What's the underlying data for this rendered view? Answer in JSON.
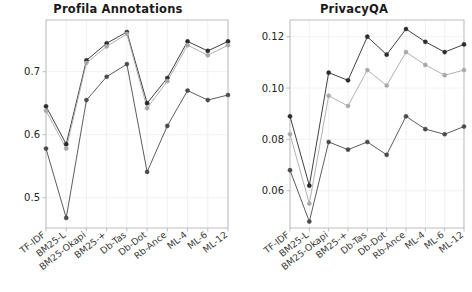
{
  "figure": {
    "width": 472,
    "height": 292,
    "background": "#ffffff"
  },
  "chart_data": [
    {
      "type": "line",
      "title": "Profila Annotations",
      "xlabel": "",
      "ylabel": "",
      "grid": true,
      "legend": "none",
      "categories": [
        "TF-IDF",
        "BM25-L",
        "BM25-Okapi",
        "BM25-+",
        "Db-Tas",
        "Db-Dot",
        "Rb-Ance",
        "ML-4",
        "ML-6",
        "ML-12"
      ],
      "ylim": [
        0.452,
        0.782
      ],
      "yticks": [
        0.5,
        0.6,
        0.7
      ],
      "ytick_labels": [
        "0.5",
        "0.6",
        "0.7"
      ],
      "series": [
        {
          "name": "series-1",
          "color": "#2b2b2b",
          "values": [
            0.645,
            0.585,
            0.718,
            0.745,
            0.763,
            0.65,
            0.69,
            0.748,
            0.733,
            0.748
          ]
        },
        {
          "name": "series-2",
          "color": "#a8a8a8",
          "values": [
            0.638,
            0.578,
            0.714,
            0.74,
            0.76,
            0.642,
            0.685,
            0.742,
            0.726,
            0.742
          ]
        },
        {
          "name": "series-3",
          "color": "#4a4a4a",
          "values": [
            0.578,
            0.468,
            0.655,
            0.692,
            0.712,
            0.541,
            0.614,
            0.67,
            0.655,
            0.663
          ]
        }
      ]
    },
    {
      "type": "line",
      "title": "PrivacyQA",
      "xlabel": "",
      "ylabel": "",
      "grid": true,
      "legend": "none",
      "categories": [
        "TF-IDF",
        "BM25-L",
        "BM25-Okapi",
        "BM25-+",
        "Db-Tas",
        "Db-Dot",
        "Rb-Ance",
        "ML-4",
        "ML-6",
        "ML-12"
      ],
      "ylim": [
        0.0455,
        0.1265
      ],
      "yticks": [
        0.06,
        0.08,
        0.1,
        0.12
      ],
      "ytick_labels": [
        "0.06",
        "0.08",
        "0.10",
        "0.12"
      ],
      "series": [
        {
          "name": "series-1",
          "color": "#2b2b2b",
          "values": [
            0.089,
            0.062,
            0.106,
            0.103,
            0.12,
            0.113,
            0.123,
            0.118,
            0.114,
            0.117
          ]
        },
        {
          "name": "series-2",
          "color": "#a8a8a8",
          "values": [
            0.082,
            0.055,
            0.097,
            0.093,
            0.107,
            0.101,
            0.114,
            0.109,
            0.105,
            0.107
          ]
        },
        {
          "name": "series-3",
          "color": "#4a4a4a",
          "values": [
            0.068,
            0.048,
            0.079,
            0.076,
            0.079,
            0.074,
            0.089,
            0.084,
            0.082,
            0.085
          ]
        }
      ]
    }
  ],
  "style": {
    "axis_color": "#bdbdbd",
    "grid_color": "#eeeeee",
    "tick_text_color": "#222222",
    "title_color": "#1a1a1a"
  }
}
